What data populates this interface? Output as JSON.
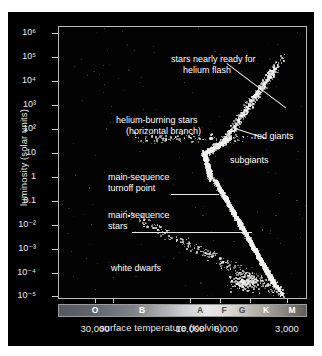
{
  "figure": {
    "background": "#000000",
    "plot_background": "#030303",
    "frame_color": "#b9b9b9",
    "star_color": "#f2f2ee"
  },
  "chart_data": {
    "type": "scatter",
    "title": "",
    "xlabel": "surface temperature (Kelvin)",
    "ylabel": "luminosity (solar units)",
    "grid": false,
    "legend": "none",
    "x_axis": {
      "scale": "log-reversed",
      "tick_labels": [
        "30,000",
        "10,000",
        "6,000",
        "3,000"
      ],
      "tick_values": [
        30000,
        10000,
        6000,
        3000
      ],
      "spectral_classes": [
        "O",
        "B",
        "A",
        "F",
        "G",
        "K",
        "M"
      ],
      "spectral_bar_gradient": "blue-white-to-red greyscale ramp"
    },
    "y_axis": {
      "scale": "log",
      "tick_labels": [
        "10⁶",
        "10⁵",
        "10⁴",
        "10³",
        "10²",
        "10",
        "1",
        "0.1",
        "10⁻²",
        "10⁻³",
        "10⁻⁴",
        "10⁻⁵"
      ],
      "tick_values": [
        1000000,
        100000,
        10000,
        1000,
        100,
        10,
        1,
        0.1,
        0.01,
        0.001,
        0.0001,
        1e-05
      ],
      "ylim": [
        1e-05,
        1000000
      ]
    },
    "annotations": [
      {
        "id": "helium-flash",
        "label": "stars nearly ready for\nhelium flash",
        "line1": "stars nearly ready for",
        "line2": "helium flash"
      },
      {
        "id": "horizontal-branch",
        "label": "helium-burning stars\n(horizontal branch)",
        "line1": "helium-burning stars",
        "line2": "(horizontal branch)"
      },
      {
        "id": "red-giants",
        "label": "red giants",
        "line1": "red giants",
        "line2": ""
      },
      {
        "id": "subgiants",
        "label": "subgiants",
        "line1": "subgiants",
        "line2": ""
      },
      {
        "id": "turnoff-point",
        "label": "main-sequence\nturnoff point",
        "line1": "main-sequence",
        "line2": "turnoff point"
      },
      {
        "id": "main-sequence",
        "label": "main-sequence\nstars",
        "line1": "main-sequence",
        "line2": "stars"
      },
      {
        "id": "white-dwarfs",
        "label": "white dwarfs",
        "line1": "white dwarfs",
        "line2": ""
      }
    ],
    "populations": [
      {
        "name": "main sequence",
        "description": "dense band from turnoff point down-right to low luminosity"
      },
      {
        "name": "subgiant branch",
        "description": "bridge right of turnoff"
      },
      {
        "name": "red giant branch",
        "description": "rising scatter toward cool, luminous corner"
      },
      {
        "name": "horizontal branch",
        "description": "sparse stars near L~50 across mid temperatures"
      },
      {
        "name": "white dwarfs",
        "description": "diagonal scatter below L~0.1"
      }
    ]
  }
}
